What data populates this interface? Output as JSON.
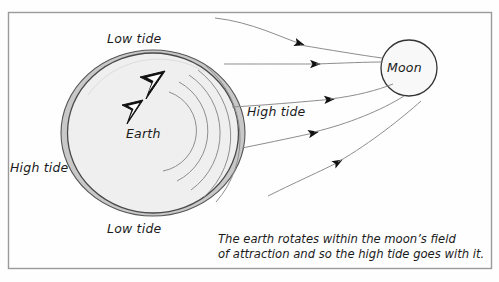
{
  "figure": {
    "type": "diagram",
    "frame": {
      "x": 8,
      "y": 12,
      "width": 484,
      "height": 257,
      "border_color": "#9a9a9a"
    },
    "background_color": "#fefefe"
  },
  "labels": {
    "low_tide_top": "Low tide",
    "low_tide_bottom": "Low tide",
    "high_tide_left": "High tide",
    "high_tide_right": "High tide",
    "earth": "Earth",
    "moon": "Moon"
  },
  "caption": {
    "line1": "The earth rotates within the moon’s field",
    "line2": "of attraction and so the high tide goes with it.",
    "text": "The earth rotates within the moon’s field\nof attraction and so the high tide goes with it."
  },
  "earth": {
    "center_x": 153,
    "center_y": 133,
    "tidal_bulge_rx": 92,
    "tidal_bulge_ry": 83,
    "body_rx": 85,
    "body_ry": 80,
    "ocean_fill": "#c9c9c9",
    "body_fill": "#f0f0f0",
    "outline_color": "#4a4a4a",
    "rotation_direction": "counterclockwise",
    "rotation_arrow_count": 2,
    "rotation_arc_count": 5
  },
  "moon": {
    "center_x": 409,
    "center_y": 68,
    "r": 28,
    "fill": "#f7f7f7",
    "outline_color": "#3a3a3a"
  },
  "field_lines": {
    "count": 5,
    "color": "#8d8d8d",
    "arrowhead_color": "#111111",
    "direction": "toward-moon",
    "paths": [
      {
        "id": "field-line-1",
        "start": [
          215,
          18
        ],
        "end": [
          381,
          58
        ],
        "arrow_at": [
          304,
          45
        ]
      },
      {
        "id": "field-line-2",
        "start": [
          224,
          64
        ],
        "end": [
          383,
          63
        ],
        "arrow_at": [
          320,
          64
        ]
      },
      {
        "id": "field-line-3",
        "start": [
          232,
          107
        ],
        "end": [
          392,
          84
        ],
        "arrow_at": [
          334,
          100
        ]
      },
      {
        "id": "field-line-4",
        "start": [
          242,
          148
        ],
        "end": [
          404,
          96
        ],
        "arrow_at": [
          317,
          132
        ]
      },
      {
        "id": "field-line-5",
        "start": [
          268,
          196
        ],
        "end": [
          421,
          100
        ],
        "arrow_at": [
          341,
          161
        ]
      }
    ]
  }
}
